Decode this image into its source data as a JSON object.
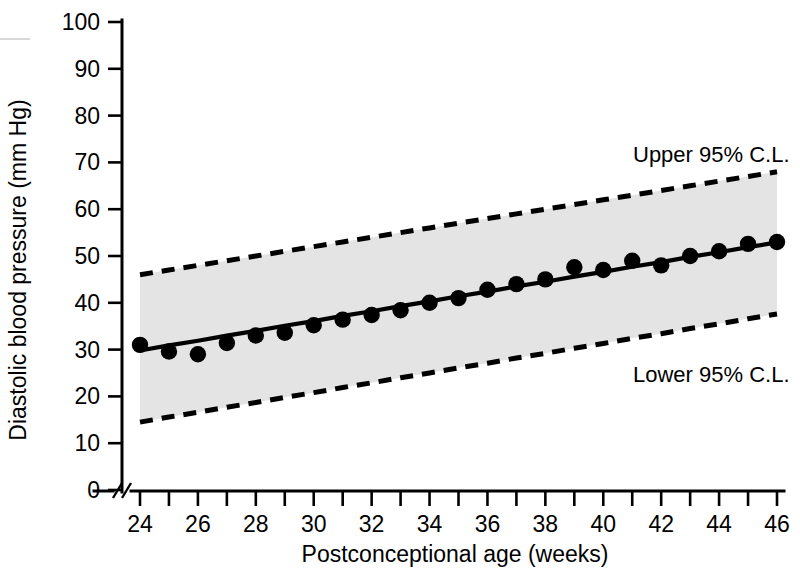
{
  "chart_data": {
    "type": "scatter",
    "title": "",
    "subtitle": "",
    "xlabel": "Postconceptional age (weeks)",
    "ylabel": "Diastolic blood pressure (mm Hg)",
    "xlim": [
      24,
      46
    ],
    "ylim": [
      0,
      100
    ],
    "grid": false,
    "legend_position": "inline-annotation",
    "x_ticks": [
      24,
      25,
      26,
      27,
      28,
      29,
      30,
      31,
      32,
      33,
      34,
      35,
      36,
      37,
      38,
      39,
      40,
      41,
      42,
      43,
      44,
      45,
      46
    ],
    "x_tick_labels": [
      "24",
      "",
      "26",
      "",
      "28",
      "",
      "30",
      "",
      "32",
      "",
      "34",
      "",
      "36",
      "",
      "38",
      "",
      "40",
      "",
      "42",
      "",
      "44",
      "",
      "46"
    ],
    "y_ticks": [
      0,
      10,
      20,
      30,
      40,
      50,
      60,
      70,
      80,
      90,
      100
    ],
    "y_tick_labels": [
      "0",
      "10",
      "20",
      "30",
      "40",
      "50",
      "60",
      "70",
      "80",
      "90",
      "100"
    ],
    "axis_break": {
      "axis": "x",
      "symbol": "//",
      "note": "break between origin and first tick"
    },
    "x": [
      24,
      25,
      26,
      27,
      28,
      29,
      30,
      31,
      32,
      33,
      34,
      35,
      36,
      37,
      38,
      39,
      40,
      41,
      42,
      43,
      44,
      45,
      46
    ],
    "series": [
      {
        "name": "Observed mean diastolic blood pressure",
        "type": "scatter",
        "marker": "filled-circle",
        "color": "#000000",
        "values": [
          31.0,
          29.6,
          29.0,
          31.4,
          33.0,
          33.6,
          35.2,
          36.4,
          37.4,
          38.4,
          40.0,
          41.0,
          42.8,
          44.0,
          45.0,
          47.6,
          47.0,
          49.0,
          48.0,
          50.0,
          51.0,
          52.6,
          53.0
        ]
      },
      {
        "name": "Regression line",
        "type": "line",
        "style": "solid",
        "color": "#000000",
        "values": [
          29.8,
          30.9,
          31.9,
          33.0,
          34.0,
          35.1,
          36.1,
          37.2,
          38.2,
          39.3,
          40.3,
          41.4,
          42.4,
          43.5,
          44.5,
          45.6,
          46.6,
          47.7,
          48.7,
          49.8,
          50.8,
          51.9,
          52.9
        ]
      },
      {
        "name": "Upper 95% C.L.",
        "type": "line",
        "style": "dashed",
        "color": "#000000",
        "values": [
          46.0,
          47.0,
          48.0,
          49.0,
          50.0,
          51.0,
          52.0,
          53.0,
          54.0,
          55.0,
          56.0,
          57.0,
          58.0,
          59.0,
          60.0,
          61.0,
          62.0,
          63.0,
          64.0,
          65.0,
          66.0,
          67.0,
          68.0
        ]
      },
      {
        "name": "Lower 95% C.L.",
        "type": "line",
        "style": "dashed",
        "color": "#000000",
        "values": [
          14.5,
          15.6,
          16.6,
          17.7,
          18.7,
          19.8,
          20.8,
          21.9,
          22.9,
          24.0,
          25.0,
          26.1,
          27.1,
          28.2,
          29.2,
          30.3,
          31.3,
          32.4,
          33.4,
          34.5,
          35.5,
          36.6,
          37.6
        ]
      }
    ],
    "shaded_band": {
      "label": "95% confidence band",
      "fill_color": "#e4e4e4",
      "upper_series": "Upper 95% C.L.",
      "lower_series": "Lower 95% C.L."
    },
    "annotations": [
      {
        "id": "upper_cl",
        "text": "Upper 95% C.L.",
        "x": 42.5,
        "y": 72
      },
      {
        "id": "lower_cl",
        "text": "Lower 95% C.L.",
        "x": 42.5,
        "y": 24
      }
    ]
  },
  "axes": {
    "y_title": "Diastolic blood pressure (mm Hg)",
    "x_title": "Postconceptional age (weeks)",
    "y_labels": [
      "100",
      "90",
      "80",
      "70",
      "60",
      "50",
      "40",
      "30",
      "20",
      "10",
      "0"
    ],
    "x_labels": [
      "24",
      "26",
      "28",
      "30",
      "32",
      "34",
      "36",
      "38",
      "40",
      "42",
      "44",
      "46"
    ]
  },
  "annotations": {
    "upper": "Upper 95% C.L.",
    "lower": "Lower 95% C.L."
  },
  "colors": {
    "band": "#e4e4e4",
    "ink": "#000000",
    "background": "#ffffff"
  }
}
